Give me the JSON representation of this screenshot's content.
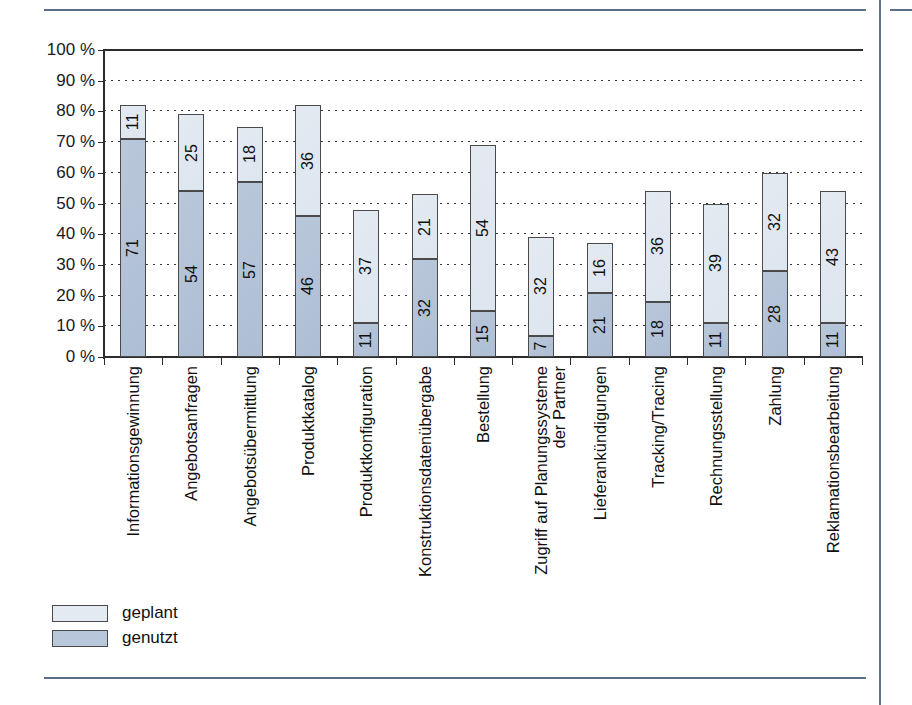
{
  "chart_data": {
    "type": "bar",
    "subtype": "stacked-vertical",
    "title": "",
    "xlabel": "",
    "ylabel": "",
    "ylim": [
      0,
      100
    ],
    "grid": true,
    "legend_position": "bottom-left",
    "y_ticks": [
      "0 %",
      "10 %",
      "20 %",
      "30 %",
      "40 %",
      "50 %",
      "60 %",
      "70 %",
      "80 %",
      "90 %",
      "100 %"
    ],
    "y_tick_values": [
      0,
      10,
      20,
      30,
      40,
      50,
      60,
      70,
      80,
      90,
      100
    ],
    "categories": [
      "Informationsgewinnung",
      "Angebotsanfragen",
      "Angebotsübermittlung",
      "Produktkatalog",
      "Produktkonfiguration",
      "Konstruktionsdatenübergabe",
      "Bestellung",
      "Zugriff auf Planungssysteme der Partner",
      "Lieferankündigungen",
      "Tracking/Tracing",
      "Rechnungsstellung",
      "Zahlung",
      "Reklamationsbearbeitung"
    ],
    "category_lines": [
      [
        "Informationsgewinnung"
      ],
      [
        "Angebotsanfragen"
      ],
      [
        "Angebotsübermittlung"
      ],
      [
        "Produktkatalog"
      ],
      [
        "Produktkonfiguration"
      ],
      [
        "Konstruktionsdatenübergabe"
      ],
      [
        "Bestellung"
      ],
      [
        "Zugriff auf Planungssysteme",
        "der Partner"
      ],
      [
        "Lieferankündigungen"
      ],
      [
        "Tracking/Tracing"
      ],
      [
        "Rechnungsstellung"
      ],
      [
        "Zahlung"
      ],
      [
        "Reklamationsbearbeitung"
      ]
    ],
    "series": [
      {
        "name": "genutzt",
        "color": "#b9c7da",
        "values": [
          71,
          54,
          57,
          46,
          11,
          32,
          15,
          7,
          21,
          18,
          11,
          28,
          11
        ]
      },
      {
        "name": "geplant",
        "color": "#e3eaf2",
        "values": [
          11,
          25,
          18,
          36,
          37,
          21,
          54,
          32,
          16,
          36,
          39,
          32,
          43
        ]
      }
    ],
    "totals": [
      82,
      79,
      75,
      82,
      48,
      53,
      69,
      39,
      37,
      54,
      50,
      60,
      54
    ]
  },
  "legend": {
    "items": [
      {
        "label": "geplant",
        "color": "#e3eaf2"
      },
      {
        "label": "genutzt",
        "color": "#b9c7da"
      }
    ]
  },
  "colors": {
    "planned": "#e3eaf2",
    "used": "#b9c7da",
    "axis": "#2b2b2b",
    "rule": "#5b6f8c"
  }
}
